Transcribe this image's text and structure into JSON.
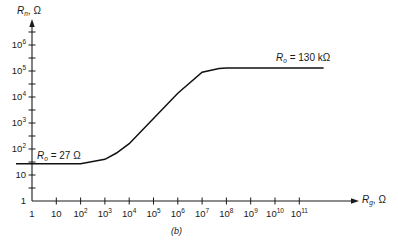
{
  "chart_data": {
    "type": "line",
    "title": "",
    "caption": "(b)",
    "xlabel": "R_g, Ω",
    "ylabel": "R_n, Ω",
    "xscale": "log",
    "yscale": "log",
    "xlim": [
      1,
      1000000000000.0
    ],
    "ylim": [
      1,
      10000000.0
    ],
    "grid": false,
    "legend": "none",
    "x_ticks": [
      {
        "base": "1",
        "exp": ""
      },
      {
        "base": "10",
        "exp": ""
      },
      {
        "base": "10",
        "exp": "2"
      },
      {
        "base": "10",
        "exp": "3"
      },
      {
        "base": "10",
        "exp": "4"
      },
      {
        "base": "10",
        "exp": "5"
      },
      {
        "base": "10",
        "exp": "6"
      },
      {
        "base": "10",
        "exp": "7"
      },
      {
        "base": "10",
        "exp": "8"
      },
      {
        "base": "10",
        "exp": "9"
      },
      {
        "base": "10",
        "exp": "10"
      },
      {
        "base": "10",
        "exp": "11"
      }
    ],
    "y_ticks": [
      {
        "base": "1",
        "exp": ""
      },
      {
        "base": "10",
        "exp": ""
      },
      {
        "base": "10",
        "exp": "2"
      },
      {
        "base": "10",
        "exp": "3"
      },
      {
        "base": "10",
        "exp": "4"
      },
      {
        "base": "10",
        "exp": "5"
      },
      {
        "base": "10",
        "exp": "6"
      }
    ],
    "series": [
      {
        "name": "R_n vs R_g",
        "x": [
          1,
          10,
          100,
          1000,
          3000,
          10000,
          100000,
          1000000,
          10000000,
          50000000,
          100000000,
          1000000000,
          10000000000,
          100000000000,
          1000000000000
        ],
        "y": [
          27,
          27,
          27,
          40,
          70,
          160,
          1500,
          14000,
          90000,
          125000,
          130000,
          130000,
          130000,
          130000,
          130000
        ]
      }
    ],
    "annotations": [
      {
        "text_var": "R",
        "text_sub": "o",
        "text_rest": " = 27 Ω",
        "x": 1,
        "y": 27,
        "position": "above-right"
      },
      {
        "text_var": "R",
        "text_sub": "o",
        "text_rest": " = 130 kΩ",
        "x": 1000000000.0,
        "y": 130000,
        "position": "above"
      }
    ]
  }
}
